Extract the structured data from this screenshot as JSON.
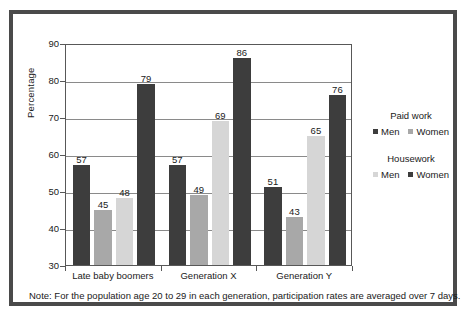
{
  "chart_data": {
    "type": "bar",
    "title": "",
    "subtitle": "",
    "xlabel": "",
    "ylabel": "Percentage",
    "ylim": [
      30,
      90
    ],
    "yticks": [
      30,
      40,
      50,
      60,
      70,
      80,
      90
    ],
    "grid": true,
    "legend_position": "right",
    "categories": [
      "Late baby boomers",
      "Generation X",
      "Generation Y"
    ],
    "series": [
      {
        "name": "Paid work Men",
        "group": "Paid work",
        "sex": "Men",
        "color": "#3d3d3d",
        "values": [
          57,
          57,
          51
        ]
      },
      {
        "name": "Paid work Women",
        "group": "Paid work",
        "sex": "Women",
        "color": "#a8a8a8",
        "values": [
          45,
          49,
          43
        ]
      },
      {
        "name": "Housework Men",
        "group": "Housework",
        "sex": "Men",
        "color": "#d6d6d6",
        "values": [
          48,
          69,
          65
        ]
      },
      {
        "name": "Housework Women",
        "group": "Housework",
        "sex": "Women",
        "color": "#3d3d3d",
        "values": [
          79,
          86,
          76
        ]
      }
    ],
    "annotations": [
      "Note: For the population age 20 to 29 in each generation, participation rates are averaged over 7 days."
    ]
  },
  "axis": {
    "y_label": "Percentage",
    "y_ticks": [
      "90",
      "80",
      "70",
      "60",
      "50",
      "40",
      "30"
    ],
    "x_categories": [
      "Late baby boomers",
      "Generation X",
      "Generation Y"
    ]
  },
  "bar_values": {
    "g0": [
      "57",
      "45",
      "48",
      "79"
    ],
    "g1": [
      "57",
      "49",
      "69",
      "86"
    ],
    "g2": [
      "51",
      "43",
      "65",
      "76"
    ]
  },
  "legend": {
    "paid_work": {
      "title": "Paid work",
      "men_label": "Men",
      "women_label": "Women",
      "men_color": "#3d3d3d",
      "women_color": "#a8a8a8"
    },
    "housework": {
      "title": "Housework",
      "men_label": "Men",
      "women_label": "Women",
      "men_color": "#d6d6d6",
      "women_color": "#3d3d3d"
    }
  },
  "note": {
    "text": "Note: For the population age 20 to 29 in each generation, participation rates are averaged over 7 days."
  },
  "colors": {
    "dark": "#3d3d3d",
    "medium": "#a8a8a8",
    "light": "#d6d6d6",
    "frame": "#4a4a4a",
    "axis": "#585858",
    "grid": "#8a8a8a"
  }
}
